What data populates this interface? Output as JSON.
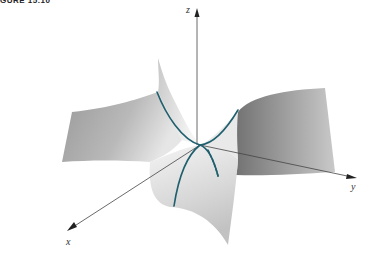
{
  "caption": "GURE 15.10",
  "figure": {
    "axes": {
      "x_label": "x",
      "y_label": "y",
      "z_label": "z"
    },
    "colors": {
      "curve": "#1f5f6e",
      "axis": "#444444",
      "surface_light": "#f2f2f2",
      "surface_dark": "#8a8a8a"
    }
  }
}
